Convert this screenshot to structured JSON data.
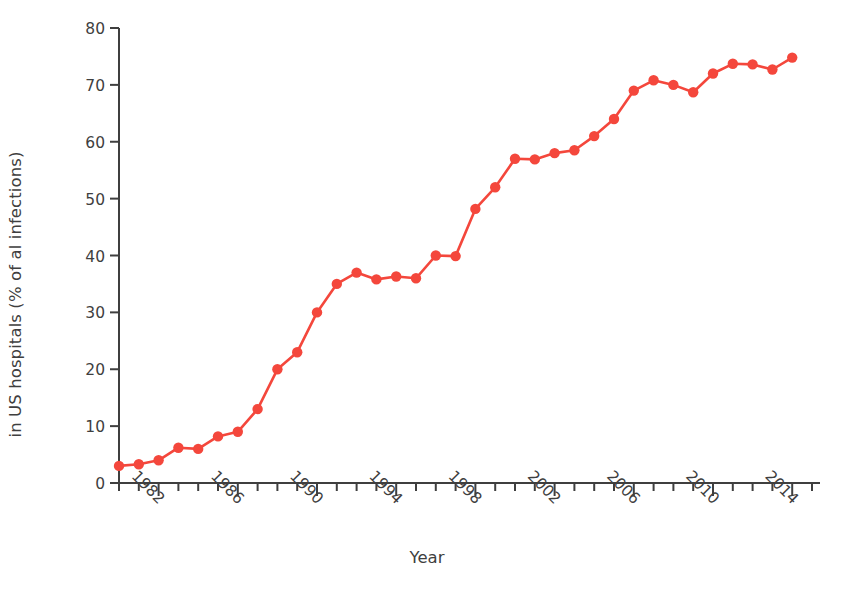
{
  "chart_data": {
    "type": "line",
    "title": "",
    "xlabel": "Year",
    "ylabel_line1": "Methicillin-resistant infections",
    "ylabel_line2": "in US hospitals (% of al  infections)",
    "series_name": "Methicillin-resistant infections",
    "color": "#F4473C",
    "grid": false,
    "legend": "none",
    "xlim": [
      1980,
      2015
    ],
    "ylim": [
      0,
      80
    ],
    "yticks": [
      0,
      10,
      20,
      30,
      40,
      50,
      60,
      70,
      80
    ],
    "ytick_labels": [
      "0",
      "10",
      "20",
      "30",
      "40",
      "50",
      "60",
      "70",
      "80"
    ],
    "xticks": [
      1982,
      1986,
      1990,
      1994,
      1998,
      2002,
      2006,
      2010,
      2014
    ],
    "xtick_labels": [
      "1982",
      "1986",
      "1990",
      "1994",
      "1998",
      "2002",
      "2006",
      "2010",
      "2014"
    ],
    "xtick_minor_step": 1,
    "x": [
      1980,
      1981,
      1982,
      1983,
      1984,
      1985,
      1986,
      1987,
      1988,
      1989,
      1990,
      1991,
      1992,
      1993,
      1994,
      1995,
      1996,
      1997,
      1998,
      1999,
      2000,
      2001,
      2002,
      2003,
      2004,
      2005,
      2006,
      2007,
      2008,
      2009,
      2010,
      2011,
      2012,
      2013,
      2014
    ],
    "values": [
      3.0,
      3.3,
      4.0,
      6.2,
      6.0,
      8.2,
      9.0,
      13.0,
      20.0,
      23.0,
      30.0,
      35.0,
      37.0,
      35.8,
      36.3,
      36.0,
      40.0,
      39.9,
      48.2,
      52.0,
      57.0,
      56.9,
      58.0,
      58.5,
      61.0,
      64.0,
      69.0,
      70.8,
      70.0,
      68.7,
      72.0,
      73.7,
      73.6,
      72.7,
      74.8
    ],
    "x_unit": "year",
    "y_unit": "percent"
  }
}
